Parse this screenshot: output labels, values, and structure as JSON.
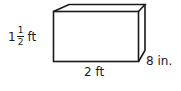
{
  "figure": {
    "shape": "rectangular-prism",
    "stroke_color": "#1a1a1a",
    "dimensions": {
      "height": {
        "whole": "1",
        "numerator": "1",
        "denominator": "2",
        "unit": "ft"
      },
      "width": {
        "label": "2 ft"
      },
      "depth": {
        "label": "8 in."
      }
    }
  }
}
